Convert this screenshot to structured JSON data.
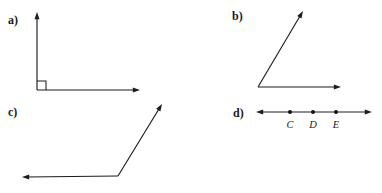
{
  "page": {
    "width": 382,
    "height": 193,
    "background": "#ffffff",
    "ink_color": "#1d1d1d"
  },
  "figures": [
    {
      "key": "a",
      "label": "a)",
      "label_x": 8,
      "label_y": 14,
      "type": "right-angle",
      "description": "right angle formed by a vertical ray and a horizontal ray meeting at a vertex, marked with a small square",
      "vertex": {
        "x": 37,
        "y": 90
      },
      "rays": [
        {
          "name": "vertical-ray",
          "from": {
            "x": 37,
            "y": 90
          },
          "to": {
            "x": 37,
            "y": 12
          },
          "arrow": true
        },
        {
          "name": "horizontal-ray",
          "from": {
            "x": 37,
            "y": 90
          },
          "to": {
            "x": 140,
            "y": 90
          },
          "arrow": true
        }
      ],
      "right_angle_marker": {
        "x": 37,
        "y": 81,
        "size": 9
      }
    },
    {
      "key": "b",
      "label": "b)",
      "label_x": 232,
      "label_y": 10,
      "type": "acute-angle",
      "description": "acute angle formed by a ray going up and to the right and a horizontal ray going right",
      "vertex": {
        "x": 258,
        "y": 87
      },
      "rays": [
        {
          "name": "diagonal-ray",
          "from": {
            "x": 258,
            "y": 87
          },
          "to": {
            "x": 303,
            "y": 11
          },
          "arrow": true
        },
        {
          "name": "horizontal-ray",
          "from": {
            "x": 258,
            "y": 87
          },
          "to": {
            "x": 341,
            "y": 87
          },
          "arrow": true
        }
      ]
    },
    {
      "key": "c",
      "label": "c)",
      "label_x": 8,
      "label_y": 106,
      "type": "obtuse-angle",
      "description": "obtuse angle formed by a ray going up and to the right and a horizontal ray going left",
      "vertex": {
        "x": 118,
        "y": 176
      },
      "rays": [
        {
          "name": "diagonal-ray",
          "from": {
            "x": 118,
            "y": 176
          },
          "to": {
            "x": 162,
            "y": 104
          },
          "arrow": true
        },
        {
          "name": "horizontal-ray",
          "from": {
            "x": 118,
            "y": 176
          },
          "to": {
            "x": 22,
            "y": 177
          },
          "arrow": true
        }
      ]
    },
    {
      "key": "d",
      "label": "d)",
      "label_x": 233,
      "label_y": 107,
      "type": "number-line",
      "description": "a line with arrowheads at both ends containing three labeled points",
      "line": {
        "from": {
          "x": 256,
          "y": 112
        },
        "to": {
          "x": 372,
          "y": 112
        },
        "arrow_start": true,
        "arrow_end": true
      },
      "points": [
        {
          "label": "C",
          "x": 290,
          "y": 112,
          "label_y": 120
        },
        {
          "label": "D",
          "x": 313,
          "y": 112,
          "label_y": 120
        },
        {
          "label": "E",
          "x": 336,
          "y": 112,
          "label_y": 120
        }
      ]
    }
  ]
}
